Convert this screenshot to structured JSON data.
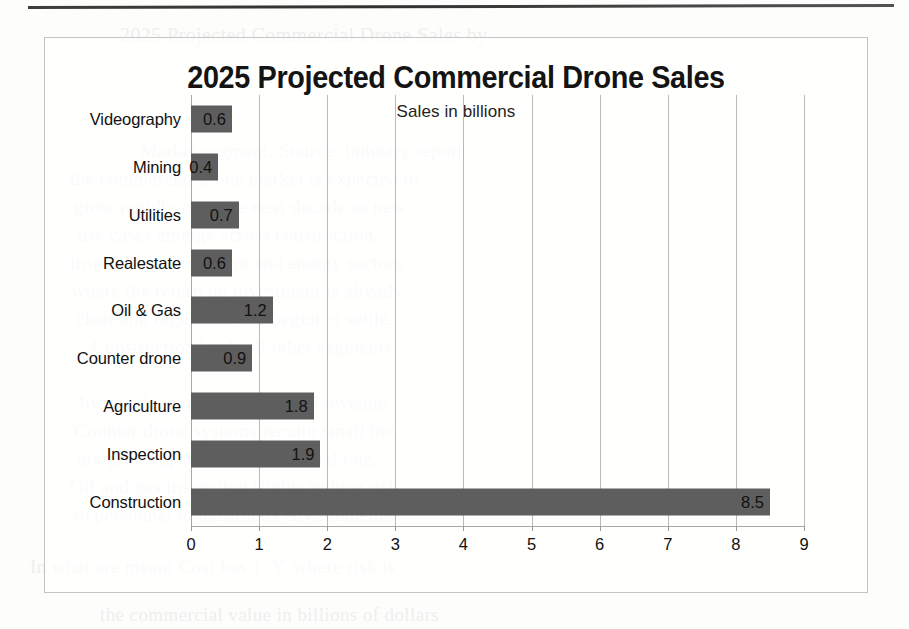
{
  "page": {
    "background_color": "#fdfdfc",
    "rule_color": "#2e2e2e",
    "ghost_text": [
      {
        "text": "2025 Projected Commercial Drone Sales by",
        "x": 120,
        "y": 24,
        "size": 20
      },
      {
        "text": "Market segment. Source: industry report",
        "x": 140,
        "y": 140,
        "size": 19
      },
      {
        "text": "the commercial drone market is expected to",
        "x": 70,
        "y": 168,
        "size": 19
      },
      {
        "text": "grow rapidly over the next decade as new",
        "x": 74,
        "y": 196,
        "size": 19
      },
      {
        "text": "use cases emerge across construction,",
        "x": 78,
        "y": 224,
        "size": 19
      },
      {
        "text": "inspection, agriculture and energy sectors",
        "x": 70,
        "y": 252,
        "size": 19
      },
      {
        "text": "where the return on investment is already",
        "x": 72,
        "y": 280,
        "size": 19
      },
      {
        "text": "clear and regulation has begun to settle.",
        "x": 76,
        "y": 308,
        "size": 19
      },
      {
        "text": "Construction leads all other segments",
        "x": 92,
        "y": 336,
        "size": 19
      },
      {
        "text": "by a wide margin in projected revenue.",
        "x": 80,
        "y": 392,
        "size": 19
      },
      {
        "text": "Counter drone systems remain small but",
        "x": 74,
        "y": 420,
        "size": 19
      },
      {
        "text": "are growing at the fastest annual rate.",
        "x": 78,
        "y": 448,
        "size": 19
      },
      {
        "text": "Oil and gas inspection flights reduce risk",
        "x": 70,
        "y": 476,
        "size": 19
      },
      {
        "text": "to personnel in hazardous environments.",
        "x": 74,
        "y": 504,
        "size": 19
      },
      {
        "text": "In what are meant Cost has 1. Y, where risk is",
        "x": 30,
        "y": 556,
        "size": 19
      },
      {
        "text": "the commercial value in billions of dollars",
        "x": 100,
        "y": 604,
        "size": 19
      }
    ]
  },
  "chart_data": {
    "type": "bar",
    "orientation": "horizontal",
    "title": "2025 Projected Commercial Drone Sales",
    "subtitle": "Sales in billions",
    "xlabel": "",
    "ylabel": "",
    "xlim": [
      0,
      9
    ],
    "grid": true,
    "legend": false,
    "bar_color": "#5e5e5e",
    "value_labels": true,
    "xticks": [
      "0",
      "1",
      "2",
      "3",
      "4",
      "5",
      "6",
      "7",
      "8",
      "9"
    ],
    "categories": [
      "Videography",
      "Mining",
      "Utilities",
      "Realestate",
      "Oil & Gas",
      "Counter drone",
      "Agriculture",
      "Inspection",
      "Construction"
    ],
    "values": [
      0.6,
      0.4,
      0.7,
      0.6,
      1.2,
      0.9,
      1.8,
      1.9,
      8.5
    ],
    "value_text": [
      "0.6",
      "0.4",
      "0.7",
      "0.6",
      "1.2",
      "0.9",
      "1.8",
      "1.9",
      "8.5"
    ]
  }
}
